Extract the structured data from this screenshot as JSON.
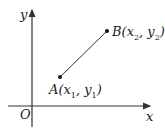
{
  "diagram": {
    "type": "coordinate-plane",
    "axes": {
      "x_label": "x",
      "y_label": "y",
      "origin_label": "O"
    },
    "points": [
      {
        "name": "A",
        "label": "A",
        "coords": [
          "x",
          "1",
          "y",
          "1"
        ]
      },
      {
        "name": "B",
        "label": "B",
        "coords": [
          "x",
          "2",
          "y",
          "2"
        ]
      }
    ],
    "segment": "AB"
  }
}
